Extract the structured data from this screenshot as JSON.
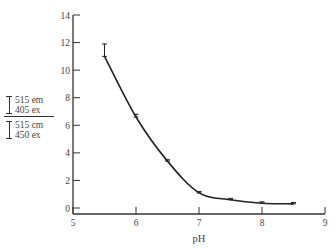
{
  "chart_data": {
    "type": "line",
    "title": "",
    "xlabel": "pH",
    "ylabel": {
      "numerator": [
        "515 em",
        "405 ex"
      ],
      "denominator": [
        "515 cm",
        "450 ex"
      ]
    },
    "xlim": [
      5,
      9
    ],
    "ylim": [
      0,
      14
    ],
    "x_ticks": [
      "5",
      "6",
      "7",
      "8",
      "9"
    ],
    "y_ticks": [
      "0",
      "2",
      "4",
      "6",
      "8",
      "10",
      "12",
      "14"
    ],
    "grid": false,
    "legend": null,
    "series": [
      {
        "name": "fluorescence ratio",
        "x": [
          5.5,
          6.0,
          6.5,
          7.0,
          7.5,
          8.0,
          8.5
        ],
        "values": [
          11.0,
          6.6,
          3.4,
          1.1,
          0.6,
          0.35,
          0.3
        ],
        "error_upper": [
          11.9,
          6.8,
          3.5,
          1.2,
          0.7,
          0.45,
          0.4
        ],
        "marker": "error-bar",
        "curve": "smooth fit"
      }
    ]
  }
}
